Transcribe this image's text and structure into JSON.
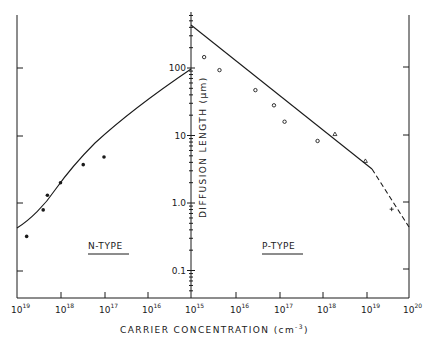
{
  "chart_data": {
    "type": "line",
    "title": "",
    "xlabel": "CARRIER CONCENTRATION (cm-3)",
    "xlabel_main": "CARRIER CONCENTRATION (cm",
    "xlabel_exp": "-3",
    "xlabel_close": ")",
    "ylabel": "DIFFUSION LENGTH (µm)",
    "yscale": "log",
    "ylim": [
      0.04,
      600
    ],
    "y_ticks": [
      "100",
      "10",
      "1.0",
      "0.1"
    ],
    "x_ticks": [
      {
        "base": "10",
        "exp": "19"
      },
      {
        "base": "10",
        "exp": "18"
      },
      {
        "base": "10",
        "exp": "17"
      },
      {
        "base": "10",
        "exp": "16"
      },
      {
        "base": "10",
        "exp": "15"
      },
      {
        "base": "10",
        "exp": "16"
      },
      {
        "base": "10",
        "exp": "17"
      },
      {
        "base": "10",
        "exp": "18"
      },
      {
        "base": "10",
        "exp": "19"
      },
      {
        "base": "10",
        "exp": "20"
      }
    ],
    "x_axis_note": "Left half (N-type) runs from 1e19 down to 1e15; right half (P-type) runs from 1e15 up to 1e20",
    "grid": false,
    "legend": null,
    "region_labels": [
      "N-TYPE",
      "P-TYPE"
    ],
    "series": [
      {
        "name": "N-type theory curve",
        "style": "solid line",
        "x": [
          1e+19,
          5e+18,
          2e+18,
          1e+18,
          5e+17,
          2e+17,
          1e+17,
          1e+16,
          1000000000000000.0
        ],
        "y": [
          0.45,
          0.75,
          1.4,
          2.3,
          4.2,
          7.5,
          11,
          38,
          100
        ]
      },
      {
        "name": "N-type measured",
        "marker": "filled circle",
        "x": [
          6e+18,
          2.5e+18,
          2e+18,
          1e+18,
          3e+17,
          1e+17
        ],
        "y": [
          0.32,
          0.79,
          1.3,
          2.0,
          3.7,
          4.8
        ]
      },
      {
        "name": "P-type theory curve",
        "style": "solid line, dashed above 1e19",
        "x": [
          1000000000000000.0,
          1e+16,
          1e+17,
          1e+18,
          1e+19,
          1e+20
        ],
        "y": [
          440,
          120,
          33,
          8.5,
          2.2,
          0.4
        ]
      },
      {
        "name": "P-type measured (circles)",
        "marker": "open circle",
        "x": [
          2000000000000000.0,
          4500000000000000.0,
          3e+16,
          8e+16,
          1.4e+17,
          8e+17
        ],
        "y": [
          145,
          93,
          47,
          28,
          16,
          8.3
        ]
      },
      {
        "name": "P-type measured (triangles)",
        "marker": "open triangle",
        "x": [
          2e+18,
          1e+19
        ],
        "y": [
          10.5,
          4.2
        ]
      },
      {
        "name": "P-type measured (cross)",
        "marker": "cross",
        "x": [
          4e+19
        ],
        "y": [
          0.81
        ]
      }
    ]
  }
}
